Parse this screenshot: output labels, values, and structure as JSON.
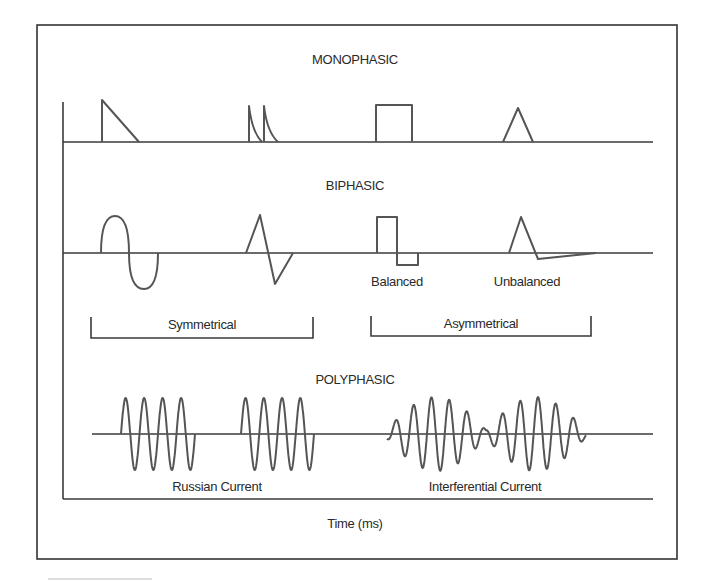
{
  "diagram": {
    "sections": {
      "monophasic": {
        "title": "MONOPHASIC"
      },
      "biphasic": {
        "title": "BIPHASIC",
        "labels": {
          "balanced": "Balanced",
          "unbalanced": "Unbalanced"
        },
        "groups": {
          "symmetrical": "Symmetrical",
          "asymmetrical": "Asymmetrical"
        }
      },
      "polyphasic": {
        "title": "POLYPHASIC",
        "labels": {
          "russian": "Russian Current",
          "interferential": "Interferential Current"
        }
      }
    },
    "x_axis_label": "Time (ms)",
    "waveforms": [
      {
        "section": "monophasic",
        "shape": "sawtooth-decay"
      },
      {
        "section": "monophasic",
        "shape": "twin-peak-exponential-spikes"
      },
      {
        "section": "monophasic",
        "shape": "rectangular"
      },
      {
        "section": "monophasic",
        "shape": "triangular"
      },
      {
        "section": "biphasic",
        "shape": "sine",
        "group": "Symmetrical"
      },
      {
        "section": "biphasic",
        "shape": "triangular",
        "group": "Symmetrical"
      },
      {
        "section": "biphasic",
        "shape": "rectangular",
        "label": "Balanced",
        "group": "Asymmetrical"
      },
      {
        "section": "biphasic",
        "shape": "triangular",
        "label": "Unbalanced",
        "group": "Asymmetrical"
      },
      {
        "section": "polyphasic",
        "shape": "burst-modulated-sine",
        "label": "Russian Current",
        "bursts": 2,
        "cycles_per_burst": 4
      },
      {
        "section": "polyphasic",
        "shape": "beat-modulated-sine",
        "label": "Interferential Current"
      }
    ]
  }
}
